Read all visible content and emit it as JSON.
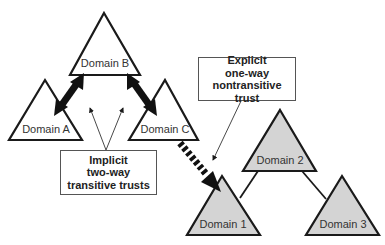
{
  "domains": {
    "a": {
      "label": "Domain A"
    },
    "b": {
      "label": "Domain B"
    },
    "c": {
      "label": "Domain C"
    },
    "d1": {
      "label": "Domain 1"
    },
    "d2": {
      "label": "Domain 2"
    },
    "d3": {
      "label": "Domain 3"
    }
  },
  "callouts": {
    "implicit": {
      "lines": [
        "Implicit",
        "two-way",
        "transitive trusts"
      ]
    },
    "explicit": {
      "lines": [
        "Explicit",
        "one-way",
        "nontransitive trust"
      ]
    }
  },
  "colors": {
    "outline": "#1a1a1a",
    "forest2_fill": "#d4d4d4",
    "forest1_fill": "#ffffff"
  }
}
